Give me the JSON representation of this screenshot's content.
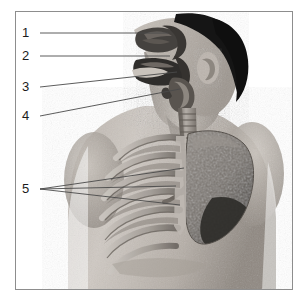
{
  "figure": {
    "kind": "anatomical-illustration",
    "view": "anterior-oblique-male-torso",
    "frame": {
      "x": 15,
      "y": 11,
      "width": 278,
      "height": 279,
      "border_color": "#8d8d8d",
      "background": "#ffffff"
    },
    "canvas": {
      "width": 306,
      "height": 303,
      "background": "#ffffff"
    }
  },
  "labels": [
    {
      "id": "1",
      "text": "1",
      "x": 22,
      "y": 26,
      "target": "nasal-cavity"
    },
    {
      "id": "2",
      "text": "2",
      "x": 22,
      "y": 49,
      "target": "pharynx"
    },
    {
      "id": "3",
      "text": "3",
      "x": 22,
      "y": 80,
      "target": "larynx"
    },
    {
      "id": "4",
      "text": "4",
      "x": 22,
      "y": 109,
      "target": "trachea"
    },
    {
      "id": "5",
      "text": "5",
      "x": 22,
      "y": 182,
      "target": "ribs"
    }
  ],
  "leader_lines": [
    {
      "label": "1",
      "from": [
        40,
        33
      ],
      "to": [
        168,
        33
      ]
    },
    {
      "label": "2",
      "from": [
        40,
        56
      ],
      "to": [
        170,
        56
      ]
    },
    {
      "label": "3",
      "from": [
        40,
        87
      ],
      "to": [
        177,
        72
      ]
    },
    {
      "label": "4",
      "from": [
        40,
        116
      ],
      "to": [
        180,
        89
      ]
    },
    {
      "label": "5a",
      "from": [
        40,
        189
      ],
      "to": [
        184,
        168
      ]
    },
    {
      "label": "5b",
      "from": [
        40,
        189
      ],
      "to": [
        176,
        186
      ]
    },
    {
      "label": "5c",
      "from": [
        40,
        189
      ],
      "to": [
        180,
        205
      ]
    }
  ],
  "colors": {
    "ink": "#1b1b1b",
    "leader": "#4a4a4a",
    "frame": "#8d8d8d",
    "skin_light": "#cfc9c3",
    "skin_mid": "#a9a29b",
    "skin_dark": "#7c756e",
    "hair": "#1a1a1a",
    "airway_dark": "#3c3a38",
    "trachea": "#8e8882",
    "rib_light": "#d6d2cc",
    "rib_shadow": "#6f6a65",
    "lung_mid": "#837d77",
    "lung_dark": "#3f3c39",
    "cavity_dark": "#4a4744"
  },
  "anatomy_parts": [
    {
      "name": "nasal-cavity"
    },
    {
      "name": "oral-cavity"
    },
    {
      "name": "pharynx"
    },
    {
      "name": "larynx"
    },
    {
      "name": "trachea"
    },
    {
      "name": "rib-cage"
    },
    {
      "name": "left-lung"
    },
    {
      "name": "head-and-hair"
    },
    {
      "name": "ear"
    },
    {
      "name": "neck"
    },
    {
      "name": "shoulders"
    },
    {
      "name": "torso"
    }
  ]
}
